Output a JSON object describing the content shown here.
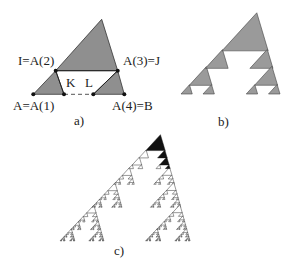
{
  "figure": {
    "panel_a": {
      "caption": "a)",
      "labels": {
        "point_i": "I=A(2)",
        "point_j": "A(3)=J",
        "point_a": "A=A(1)",
        "point_b": "A(4)=B",
        "point_k": "K",
        "point_l": "L"
      },
      "fill_color": "#8f8f8f",
      "stroke_color": "#222222"
    },
    "panel_b": {
      "caption": "b)",
      "iterations": 2,
      "fill_color": "#9a9a9a"
    },
    "panel_c": {
      "caption": "c)",
      "iterations": 5,
      "fill_color": "#111111"
    },
    "generator": {
      "description": "Each triangle on base [0,1] is replaced by three similar sub-triangles",
      "base_triangle": {
        "base": [
          [
            0,
            0
          ],
          [
            1,
            0
          ]
        ],
        "apex": [
          0.754,
          0.824
        ]
      },
      "sub_triangles": [
        {
          "name": "left",
          "base": [
            [
              0,
              0
            ],
            [
              0.337,
              0
            ]
          ],
          "apex": [
            0.246,
            0.259
          ]
        },
        {
          "name": "top",
          "base": [
            [
              0.246,
              0.259
            ],
            [
              0.929,
              0.259
            ]
          ],
          "apex": [
            0.754,
            0.824
          ]
        },
        {
          "name": "right",
          "base": [
            [
              0.659,
              0
            ],
            [
              1,
              0
            ]
          ],
          "apex": [
            0.929,
            0.259
          ]
        }
      ]
    }
  }
}
